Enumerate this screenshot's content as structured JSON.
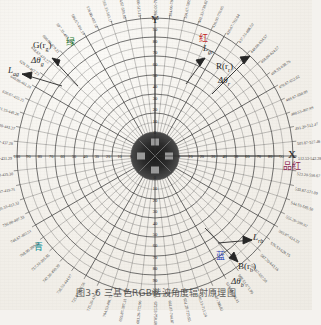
{
  "figure": {
    "title_caption": "图3-6  三基色RGB谐波角度辐射原理图",
    "axes": {
      "y_label": "Y",
      "x_label": "X"
    },
    "colors": {
      "green": "#1d7a31",
      "red": "#c0231d",
      "blue": "#1f3fb5",
      "cyan": "#0f8f96",
      "magenta": "#8e1f52",
      "grid": "#3a3a3a",
      "paper": "#f2efe9"
    },
    "vector_labels": [
      {
        "name": "G(r_g)",
        "fn": "G(r",
        "fn_sub": "g",
        "fn_end": ")",
        "delta": "Δθ",
        "delta_sub": "g",
        "cn": "绿",
        "cn_color": "green"
      },
      {
        "name": "R(r_r)",
        "fn": "R(r",
        "fn_sub": "r",
        "fn_end": ")",
        "delta": "Δθ",
        "delta_sub": "r",
        "cn": "红",
        "cn_color": "red"
      },
      {
        "name": "B(r_b)",
        "fn": "B(r",
        "fn_sub": "b",
        "fn_end": ")",
        "delta": "Δθ",
        "delta_sub": "b",
        "cn": "蓝",
        "cn_color": "blue"
      }
    ],
    "arc_labels": [
      {
        "text": "L",
        "sub": "ag",
        "position": "upper-left"
      },
      {
        "text": "L",
        "sub": "gr",
        "position": "upper-right"
      },
      {
        "text": "L",
        "sub": "rb",
        "position": "lower-right"
      }
    ],
    "secondary_color_labels": [
      {
        "cn": "青",
        "cn_color": "cyan",
        "position": "lower-left"
      },
      {
        "cn": "品红",
        "cn_color": "magenta",
        "position": "right"
      }
    ],
    "radial_scale_values": [
      100,
      90,
      80,
      70,
      60,
      50,
      40,
      30,
      20,
      10,
      0
    ],
    "angle_range_labels": [
      "380.00-760.00",
      "384.00-780.71",
      "394.67-789.61",
      "402.33-739.82",
      "416.00-770.65",
      "426.67-762.04",
      "437.33-488.50",
      "448.00-624.57",
      "458.00-624.57",
      "469.33-638.76",
      "470.67-652.02",
      "469.67-650.09",
      "480.53-497.99",
      "491.20-512.47",
      "501.87-527.46",
      "512.53-542.28",
      "523.20-556.67",
      "533.87-571.09",
      "544.53-585.50",
      "555.20-599.92",
      "565.87-614.33",
      "576.53-628.75",
      "587.20-643.16",
      "597.87-657.58",
      "608.53-671.99",
      "619.20-686.41",
      "629.87-700.82",
      "640.53-715.24",
      "651.20-729.65",
      "661.87-744.07",
      "672.53-758.48",
      "683.20-772.90",
      "693.87-787.31",
      "704.53-401.73",
      "715.20-416.14",
      "725.87-430.56",
      "736.53-444.97",
      "747.20-459.39",
      "757.33-395.85",
      "768.00-390.35",
      "746.67-403.51",
      "736.00-407.33",
      "725.33-413.32",
      "714.67-419.31",
      "704.00-425.30",
      "693.33-431.29",
      "682.67-437.28",
      "672.00-443.27",
      "661.33-449.26",
      "650.67-455.25",
      "640.00-461.24",
      "629.33-467.23",
      "618.67-473.22",
      "608.00-479.21",
      "597.33-485.20",
      "586.67-491.19",
      "576.00-497.18",
      "565.33-503.17",
      "554.67-509.16",
      "544.00-515.15"
    ]
  }
}
